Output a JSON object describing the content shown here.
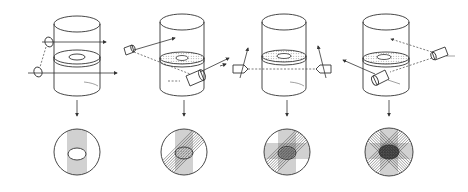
{
  "diagram": {
    "colors": {
      "line": "#333333",
      "background": "#ffffff"
    },
    "panels": [
      {
        "id": 1,
        "num_projections": 1,
        "projection_angles_deg": [
          90
        ],
        "scanner": "parallel-source-pair-left"
      },
      {
        "id": 2,
        "num_projections": 2,
        "projection_angles_deg": [
          90,
          135
        ],
        "scanner": "oblique-sources"
      },
      {
        "id": 3,
        "num_projections": 3,
        "projection_angles_deg": [
          90,
          135,
          0
        ],
        "scanner": "horizontal-source-detector"
      },
      {
        "id": 4,
        "num_projections": 4,
        "projection_angles_deg": [
          90,
          135,
          0,
          45
        ],
        "scanner": "oblique-sources-right"
      }
    ]
  }
}
